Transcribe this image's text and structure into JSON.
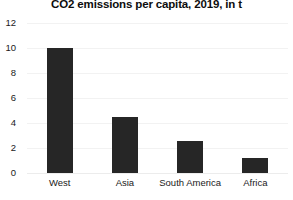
{
  "chart_data": {
    "type": "bar",
    "title": "CO2 emissions per capita, 2019, in t",
    "xlabel": "",
    "ylabel": "",
    "categories": [
      "West",
      "Asia",
      "South America",
      "Africa"
    ],
    "values": [
      10.0,
      4.5,
      2.6,
      1.2
    ],
    "ylim": [
      0,
      12
    ],
    "yticks": [
      0,
      2,
      4,
      6,
      8,
      10,
      12
    ],
    "ytick_labels": [
      "0",
      "2",
      "4",
      "6",
      "8",
      "10",
      "12"
    ],
    "grid": true,
    "grid_axis": "y",
    "legend": false,
    "bar_color": "#262626",
    "grid_color": "#f2f2f2",
    "background_color": "#ffffff"
  }
}
